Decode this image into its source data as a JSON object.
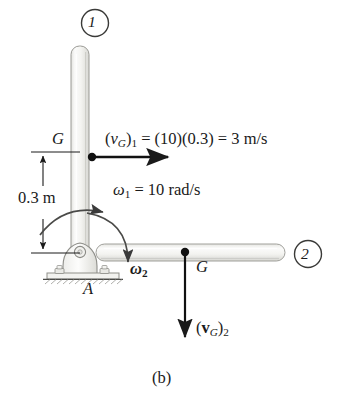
{
  "figure": {
    "caption": "(b)",
    "markers": [
      {
        "name": "position-1",
        "label": "1"
      },
      {
        "name": "position-2",
        "label": "2"
      }
    ],
    "labels": {
      "center_of_mass_vertical": "G",
      "center_of_mass_horizontal": "G",
      "support_point": "A",
      "dimension": "0.3 m",
      "omega2": "ω2"
    },
    "equations": {
      "velocity_1_prefix": "(",
      "velocity_1": "(v_G)_1 = (10)(0.3) = 3 m/s",
      "velocity_1_var": "v",
      "velocity_1_sub": "G",
      "velocity_1_index": "1",
      "velocity_1_rhs": " = (10)(0.3) = 3 m/s",
      "omega_1_var": "ω",
      "omega_1_index": "1",
      "omega_1_rhs": " = 10 rad/s",
      "velocity_2_var": "v",
      "velocity_2_sub": "G",
      "velocity_2_index": "2"
    },
    "values": {
      "angular_velocity_1": 10,
      "angular_velocity_1_units": "rad/s",
      "distance": 0.3,
      "distance_units": "m",
      "velocity_G1": 3,
      "velocity_G1_units": "m/s"
    },
    "colors": {
      "ink": "#1a1a1a",
      "rod_fill": "#f2f2f0",
      "rod_edge": "#9a9a96",
      "rod_shadow": "#d8d8d4",
      "ground": "#8c8c88"
    }
  }
}
